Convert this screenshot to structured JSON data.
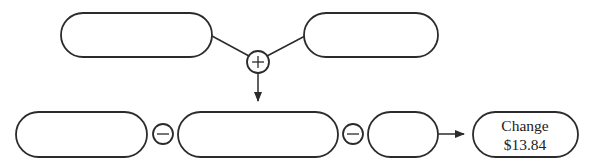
{
  "diagram": {
    "title": "",
    "top_row": [
      {
        "id": "top-left-box",
        "text": ""
      },
      {
        "id": "top-right-box",
        "text": ""
      }
    ],
    "top_operator": {
      "symbol": "+",
      "name": "plus"
    },
    "bottom_row": [
      {
        "id": "bottom-box-1",
        "text": ""
      },
      {
        "id": "bottom-box-2",
        "text": ""
      },
      {
        "id": "bottom-box-3",
        "text": ""
      }
    ],
    "bottom_operators": [
      {
        "symbol": "−",
        "name": "minus"
      },
      {
        "symbol": "−",
        "name": "minus"
      }
    ],
    "result": {
      "label": "Change",
      "value": "$13.84"
    },
    "colors": {
      "stroke": "#2b2b2b",
      "fill": "#ffffff",
      "text": "#222222"
    }
  }
}
